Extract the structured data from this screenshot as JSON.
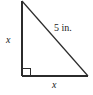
{
  "figure": {
    "type": "right-triangle-diagram",
    "background_color": "#ffffff",
    "stroke_color": "#2b2b2b",
    "labels": {
      "vertical_leg": "x",
      "horizontal_leg": "x",
      "hypotenuse": "5 in."
    },
    "geometry": {
      "apex": [
        22,
        1
      ],
      "right_angle_vertex": [
        22,
        76
      ],
      "base_end": [
        88,
        76
      ],
      "right_angle_marker_size": 8
    }
  }
}
